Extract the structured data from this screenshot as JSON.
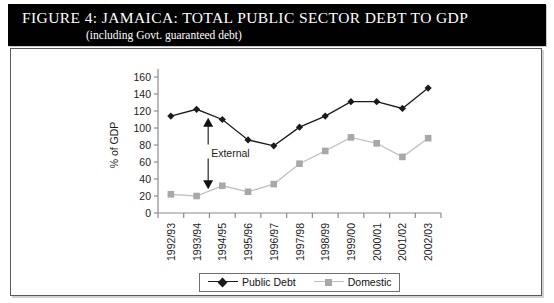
{
  "figure": {
    "title": "FIGURE 4:  JAMAICA: TOTAL PUBLIC SECTOR DEBT TO GDP",
    "subtitle": "(including Govt. guaranteed debt)"
  },
  "chart_data": {
    "type": "line",
    "title": "Jamaica: Total Public Sector Debt to GDP",
    "subtitle": "(including Govt. guaranteed debt)",
    "xlabel": "",
    "ylabel": "% of GDP",
    "ylim": [
      0,
      160
    ],
    "yticks": [
      0,
      20,
      40,
      60,
      80,
      100,
      120,
      140,
      160
    ],
    "grid": false,
    "legend_position": "bottom",
    "categories": [
      "1992/93",
      "1993/94",
      "1994/95",
      "1995/96",
      "1996/97",
      "1997/98",
      "1998/99",
      "1999/00",
      "2000/01",
      "2001/02",
      "2002/03"
    ],
    "series": [
      {
        "name": "Public Debt",
        "marker": "diamond",
        "color": "#1b1b1b",
        "values": [
          114,
          122,
          110,
          86,
          79,
          101,
          114,
          131,
          131,
          123,
          147
        ]
      },
      {
        "name": "Domestic",
        "marker": "square",
        "color": "#a8a8a8",
        "values": [
          22,
          20,
          32,
          25,
          34,
          58,
          73,
          89,
          82,
          66,
          88
        ]
      }
    ],
    "annotations": [
      {
        "text": "External",
        "type": "double-headed-arrow",
        "at_category": "1993/94",
        "from_value": 28,
        "to_value": 112
      }
    ]
  },
  "legend": {
    "items": [
      {
        "label": "Public Debt"
      },
      {
        "label": "Domestic"
      }
    ]
  },
  "colors": {
    "public_debt": "#1b1b1b",
    "domestic": "#a8a8a8",
    "axis": "#8c8c8c",
    "banner": "#010101"
  }
}
